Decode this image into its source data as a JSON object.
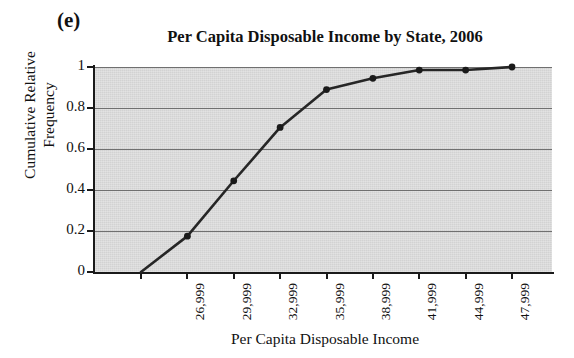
{
  "figure": {
    "panel_label": "(e)",
    "title": "Per Capita Disposable Income by State, 2006",
    "xlabel": "Per Capita Disposable Income",
    "ylabel_line1": "Cumulative Relative",
    "ylabel_line2": "Frequency",
    "colors": {
      "plot_background": "#d2d2d2",
      "gridline": "#707070",
      "axis": "#1a1a1a",
      "series_line": "#262626",
      "marker": "#1a1a1a",
      "page_background": "#ffffff",
      "text": "#111111"
    }
  },
  "chart_data": {
    "type": "line",
    "title": "Per Capita Disposable Income by State, 2006",
    "subtitle": "(e)",
    "xlabel": "Per Capita Disposable Income",
    "ylabel": "Cumulative Relative Frequency",
    "x_tick_labels": [
      "",
      "26,999",
      "29,999",
      "32,999",
      "35,999",
      "38,999",
      "41,999",
      "44,999",
      "47,999"
    ],
    "x_tick_values": [
      23999,
      26999,
      29999,
      32999,
      35999,
      38999,
      41999,
      44999,
      47999
    ],
    "y_tick_labels": [
      "0",
      "0.2",
      "0.4",
      "0.6",
      "0.8",
      "1"
    ],
    "y_tick_values": [
      0,
      0.2,
      0.4,
      0.6,
      0.8,
      1
    ],
    "ylim": [
      0,
      1
    ],
    "grid": "horizontal",
    "legend": "none",
    "markers": true,
    "series": [
      {
        "name": "Cumulative relative frequency",
        "x": [
          23999,
          26999,
          29999,
          32999,
          35999,
          38999,
          41999,
          44999,
          47999
        ],
        "values": [
          0.0,
          0.175,
          0.445,
          0.705,
          0.89,
          0.945,
          0.985,
          0.985,
          1.0
        ]
      }
    ]
  }
}
